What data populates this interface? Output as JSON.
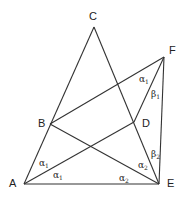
{
  "diagram": {
    "points": {
      "A": {
        "label": "A",
        "x": 24,
        "y": 184,
        "lx": 9,
        "ly": 187
      },
      "B": {
        "label": "B",
        "x": 50,
        "y": 124,
        "lx": 38,
        "ly": 127
      },
      "C": {
        "label": "C",
        "x": 94,
        "y": 27,
        "lx": 89,
        "ly": 20
      },
      "D": {
        "label": "D",
        "x": 134,
        "y": 122,
        "lx": 142,
        "ly": 127
      },
      "E": {
        "label": "E",
        "x": 159,
        "y": 184,
        "lx": 167,
        "ly": 187
      },
      "F": {
        "label": "F",
        "x": 164,
        "y": 57,
        "lx": 169,
        "ly": 54
      }
    },
    "segments": [
      [
        "A",
        "C"
      ],
      [
        "C",
        "E"
      ],
      [
        "A",
        "E"
      ],
      [
        "A",
        "D"
      ],
      [
        "B",
        "F"
      ],
      [
        "B",
        "E"
      ],
      [
        "F",
        "D"
      ],
      [
        "F",
        "E"
      ]
    ],
    "angle_labels": [
      {
        "greek": "α",
        "sub": "1",
        "x": 139,
        "y": 82,
        "near": "F"
      },
      {
        "greek": "β",
        "sub": "1",
        "x": 151,
        "y": 97,
        "near": "F"
      },
      {
        "greek": "β",
        "sub": "2",
        "x": 151,
        "y": 157,
        "near": "E"
      },
      {
        "greek": "α",
        "sub": "2",
        "x": 138,
        "y": 168,
        "near": "E"
      },
      {
        "greek": "α",
        "sub": "2",
        "x": 119,
        "y": 181,
        "near": "E"
      },
      {
        "greek": "α",
        "sub": "1",
        "x": 39,
        "y": 166,
        "near": "A"
      },
      {
        "greek": "α",
        "sub": "1",
        "x": 53,
        "y": 178,
        "near": "A"
      }
    ]
  }
}
